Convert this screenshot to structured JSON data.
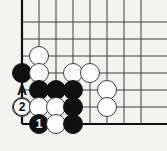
{
  "figure": {
    "kind": "go-board-diagram",
    "title": "",
    "background_color": "#f2f2f0",
    "line_color": "#3c3c3c",
    "edge_line_color": "#101010",
    "black_color": "#101010",
    "white_color": "#fdfdfd"
  },
  "board": {
    "columns": 8,
    "rows": 7,
    "origin_x": 22,
    "origin_y": 22,
    "spacing": 17,
    "edges": {
      "left": true,
      "bottom": true,
      "top": false,
      "right": false
    }
  },
  "stones": [
    {
      "name": "white-stone-c2r3",
      "color": "white",
      "col": 2,
      "row": 3,
      "label": ""
    },
    {
      "name": "black-stone-c1r4",
      "color": "black",
      "col": 1,
      "row": 4,
      "label": ""
    },
    {
      "name": "white-stone-c2r4",
      "color": "white",
      "col": 2,
      "row": 4,
      "label": ""
    },
    {
      "name": "white-stone-c4r4",
      "color": "white",
      "col": 4,
      "row": 4,
      "label": ""
    },
    {
      "name": "white-stone-c5r4",
      "color": "white",
      "col": 5,
      "row": 4,
      "label": ""
    },
    {
      "name": "black-stone-c2r5",
      "color": "black",
      "col": 2,
      "row": 5,
      "label": ""
    },
    {
      "name": "black-stone-c3r5",
      "color": "black",
      "col": 3,
      "row": 5,
      "label": ""
    },
    {
      "name": "black-stone-c4r5",
      "color": "black",
      "col": 4,
      "row": 5,
      "label": ""
    },
    {
      "name": "white-stone-c6r5",
      "color": "white",
      "col": 6,
      "row": 5,
      "label": ""
    },
    {
      "name": "white-stone-move-2-c1r6",
      "color": "white",
      "col": 1,
      "row": 6,
      "label": "2",
      "marker": "circle"
    },
    {
      "name": "white-stone-c2r6",
      "color": "white",
      "col": 2,
      "row": 6,
      "label": ""
    },
    {
      "name": "white-stone-c3r6",
      "color": "white",
      "col": 3,
      "row": 6,
      "label": ""
    },
    {
      "name": "black-stone-c4r6",
      "color": "black",
      "col": 4,
      "row": 6,
      "label": ""
    },
    {
      "name": "white-stone-c6r6",
      "color": "white",
      "col": 6,
      "row": 6,
      "label": ""
    },
    {
      "name": "black-stone-move-1-c2r7",
      "color": "black",
      "col": 2,
      "row": 7,
      "label": "1"
    },
    {
      "name": "white-stone-c3r7",
      "color": "white",
      "col": 3,
      "row": 7,
      "label": ""
    },
    {
      "name": "black-stone-c4r7",
      "color": "black",
      "col": 4,
      "row": 7,
      "label": ""
    }
  ],
  "point_labels": [
    {
      "name": "point-label-a",
      "text": "A",
      "col": 1,
      "row": 5
    }
  ]
}
